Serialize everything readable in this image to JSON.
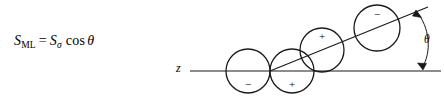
{
  "figure": {
    "background_color": "#ffffff",
    "stroke_color": "#1a1a1a",
    "width": 444,
    "height": 106
  },
  "equation": {
    "lhs_symbol": "S",
    "lhs_subscript": "ML",
    "equals": "=",
    "rhs_symbol": "S",
    "rhs_subscript": "σ",
    "function": "cos",
    "angle": "θ",
    "plain_text": "S_ML = S_σ cos θ"
  },
  "diagram": {
    "axis": {
      "label": "z",
      "label_x": 176,
      "label_y": 61,
      "y": 71,
      "x_start": 190,
      "x_end": 441
    },
    "tilted_axis": {
      "x_start": 270,
      "y_start": 71,
      "x_end": 428,
      "y_end": 7
    },
    "circles": [
      {
        "cx": 248,
        "cy": 71,
        "r": 22,
        "charge": "−",
        "charge_x": 248,
        "charge_y": 85
      },
      {
        "cx": 292,
        "cy": 71,
        "r": 22,
        "charge": "+",
        "charge_x": 292,
        "charge_y": 85
      },
      {
        "cx": 322,
        "cy": 50,
        "r": 22,
        "charge": "+",
        "charge_x": 322,
        "charge_y": 36
      },
      {
        "cx": 377,
        "cy": 28,
        "r": 23,
        "charge": "−",
        "charge_x": 377,
        "charge_y": 14
      }
    ],
    "angle_arc": {
      "label": "θ",
      "label_x": 424,
      "label_y": 33,
      "arrow_top_x": 416,
      "arrow_top_y": 10,
      "arrow_bottom_x": 423,
      "arrow_bottom_y": 70
    }
  }
}
